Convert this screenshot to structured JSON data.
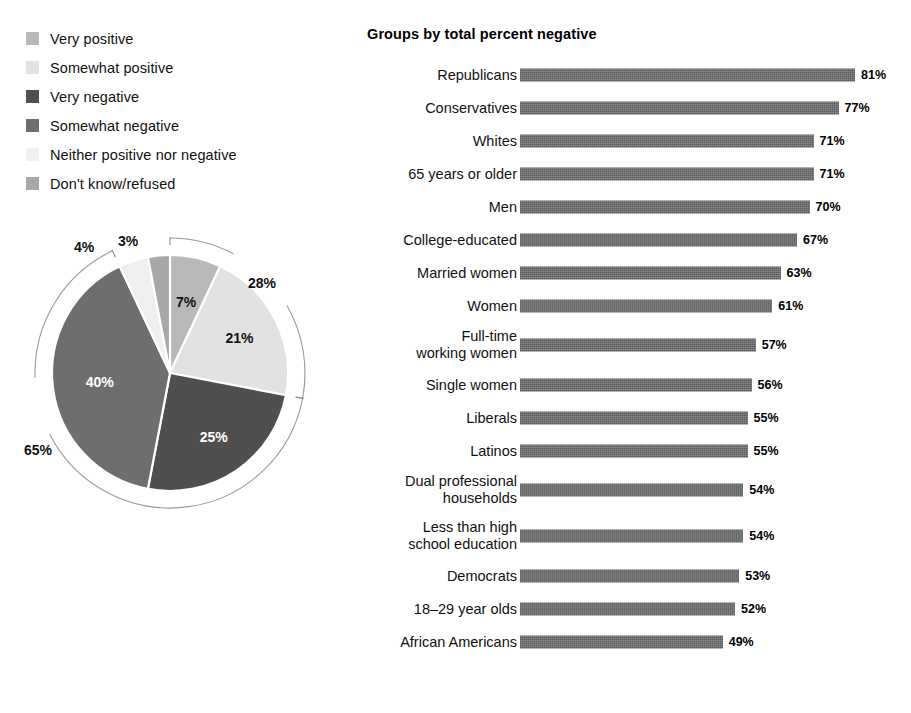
{
  "legend": {
    "items": [
      {
        "label": "Very positive",
        "color": "#b9b9b9"
      },
      {
        "label": "Somewhat positive",
        "color": "#e2e2e2"
      },
      {
        "label": "Very negative",
        "color": "#4f4f4f"
      },
      {
        "label": "Somewhat negative",
        "color": "#6e6e6e"
      },
      {
        "label": "Neither positive nor negative",
        "color": "#efefef"
      },
      {
        "label": "Don't know/refused",
        "color": "#a8a8a8"
      }
    ]
  },
  "bars": {
    "title": "Groups by total percent negative"
  },
  "chart_data": [
    {
      "type": "pie",
      "title": "",
      "legend_position": "top-left",
      "categories": [
        "Very positive",
        "Somewhat positive",
        "Very negative",
        "Somewhat negative",
        "Neither positive nor negative",
        "Don't know/refused"
      ],
      "values": [
        7,
        21,
        25,
        40,
        4,
        3
      ],
      "value_labels": [
        "7%",
        "21%",
        "25%",
        "40%",
        "4%",
        "3%"
      ],
      "colors": [
        "#b9b9b9",
        "#e2e2e2",
        "#4f4f4f",
        "#6e6e6e",
        "#efefef",
        "#a8a8a8"
      ],
      "annotations": [
        {
          "label": "28%",
          "meaning": "total positive",
          "spans": [
            "Very positive",
            "Somewhat positive"
          ]
        },
        {
          "label": "65%",
          "meaning": "total negative",
          "spans": [
            "Very negative",
            "Somewhat negative"
          ]
        }
      ]
    },
    {
      "type": "bar",
      "orientation": "horizontal",
      "title": "Groups by total percent negative",
      "xlabel": "",
      "ylabel": "",
      "xlim": [
        0,
        81
      ],
      "grid": false,
      "categories": [
        "Republicans",
        "Conservatives",
        "Whites",
        "65 years or older",
        "Men",
        "College-educated",
        "Married women",
        "Women",
        "Full-time\nworking women",
        "Single women",
        "Liberals",
        "Latinos",
        "Dual professional\nhouseholds",
        "Less than high\nschool education",
        "Democrats",
        "18–29 year olds",
        "African Americans"
      ],
      "values": [
        81,
        77,
        71,
        71,
        70,
        67,
        63,
        61,
        57,
        56,
        55,
        55,
        54,
        54,
        53,
        52,
        49
      ],
      "value_labels": [
        "81%",
        "77%",
        "71%",
        "71%",
        "70%",
        "67%",
        "63%",
        "61%",
        "57%",
        "56%",
        "55%",
        "55%",
        "54%",
        "54%",
        "53%",
        "52%",
        "49%"
      ]
    }
  ]
}
